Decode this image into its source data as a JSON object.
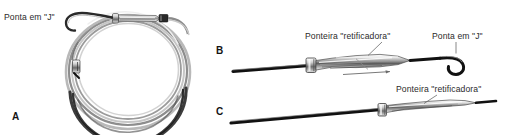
{
  "figure": {
    "background_color": "#ffffff",
    "line_color": "#1a1a1a",
    "metal_light": "#f2f2f2",
    "metal_mid": "#b8b8b8",
    "metal_dark": "#6e6e6e"
  },
  "panels": [
    {
      "id": "A",
      "letter": "A",
      "letter_x": 12,
      "letter_y": 111,
      "description_label": "Ponta em \"J\"",
      "label_x": 4,
      "label_y": 13
    },
    {
      "id": "B",
      "letter": "B",
      "letter_x": 216,
      "letter_y": 45,
      "label_left": "Ponteira \"retificadora\"",
      "label_left_x": 305,
      "label_left_y": 32,
      "label_right": "Ponta em \"J\"",
      "label_right_x": 432,
      "label_right_y": 32
    },
    {
      "id": "C",
      "letter": "C",
      "letter_x": 216,
      "letter_y": 106,
      "label_right": "Ponteira \"retificadora\"",
      "label_right_x": 396,
      "label_right_y": 85
    }
  ],
  "labels": {
    "j_tip": "Ponta em \"J\"",
    "straightener": "Ponteira \"retificadora\"",
    "panel_a": "A",
    "panel_b": "B",
    "panel_c": "C"
  },
  "icons": {
    "coil": "coiled-guidewire-icon",
    "j_hook": "j-hook-tip-icon",
    "straightener_sleeve": "straightener-sleeve-icon",
    "leader_line": "leader-line-icon"
  }
}
